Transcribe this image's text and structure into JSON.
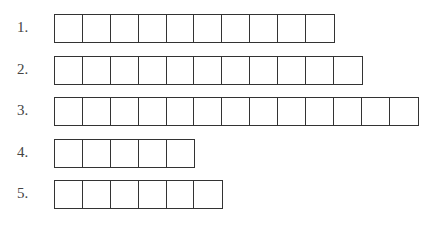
{
  "rows": [
    {
      "label": "1.",
      "cells": 10,
      "top": 14
    },
    {
      "label": "2.",
      "cells": 11,
      "top": 56
    },
    {
      "label": "3.",
      "cells": 13,
      "top": 97
    },
    {
      "label": "4.",
      "cells": 5,
      "top": 139
    },
    {
      "label": "5.",
      "cells": 6,
      "top": 180
    }
  ],
  "style": {
    "line_color": "#333333",
    "label_color": "#444444"
  }
}
